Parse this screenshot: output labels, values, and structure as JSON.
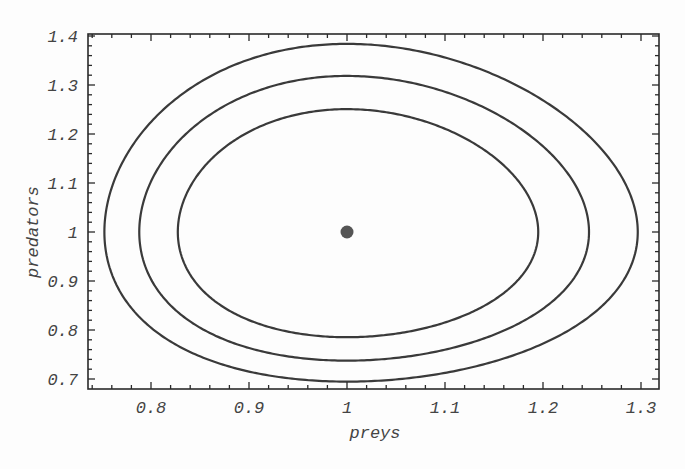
{
  "chart_data": {
    "type": "line",
    "subtype": "phase-portrait",
    "title": "",
    "xlabel": "preys",
    "ylabel": "predators",
    "xlim": [
      0.737,
      1.318
    ],
    "ylim": [
      0.68,
      1.405
    ],
    "xticks": [
      0.8,
      0.9,
      1.0,
      1.1,
      1.2,
      1.3
    ],
    "xtick_labels": [
      "0.8",
      "0.9",
      "1",
      "1.1",
      "1.2",
      "1.3"
    ],
    "yticks": [
      0.7,
      0.8,
      0.9,
      1.0,
      1.1,
      1.2,
      1.3,
      1.4
    ],
    "ytick_labels": [
      "0.7",
      "0.8",
      "0.9",
      "1",
      "1.1",
      "1.2",
      "1.3",
      "1.4"
    ],
    "minor_ticks_per_major": 5,
    "grid": false,
    "frame_ticks_all_sides": true,
    "equilibrium_point": {
      "x": 1.0,
      "y": 1.0
    },
    "orbit_equation": "1.6*(x - ln x - 1) + (y - ln y - 1) = c",
    "series": [
      {
        "name": "orbit-inner",
        "c": 0.027,
        "x_range": [
          0.829,
          1.202
        ],
        "y_range": [
          0.787,
          1.257
        ]
      },
      {
        "name": "orbit-middle",
        "c": 0.042,
        "x_range": [
          0.792,
          1.25
        ],
        "y_range": [
          0.741,
          1.32
        ]
      },
      {
        "name": "orbit-outer",
        "c": 0.059,
        "x_range": [
          0.753,
          1.303
        ],
        "y_range": [
          0.7,
          1.388
        ]
      }
    ],
    "colors": {
      "line": "#3a3a3a",
      "frame": "#2a2a2a",
      "point": "#555555",
      "background": "#fdfdfd"
    }
  },
  "layout": {
    "plot_px": {
      "left": 88,
      "top": 34,
      "right": 659,
      "bottom": 389
    },
    "x_px_per_unit": 980,
    "x_px_at_1": 347,
    "y_px_per_unit": 490,
    "y_px_at_1": 232
  }
}
